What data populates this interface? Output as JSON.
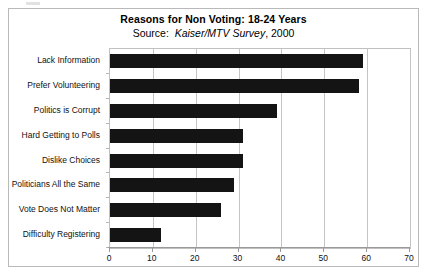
{
  "chart_data": {
    "type": "bar",
    "orientation": "horizontal",
    "title": "Reasons for Non Voting: 18-24 Years",
    "subtitle_prefix": "Source:  ",
    "subtitle_source_italic": "Kaiser/MTV Survey",
    "subtitle_suffix": ", 2000",
    "categories": [
      "Lack Information",
      "Prefer Volunteering",
      "Politics is Corrupt",
      "Hard Getting to Polls",
      "Dislike Choices",
      "Politicians All the Same",
      "Vote Does Not Matter",
      "Difficulty Registering"
    ],
    "values": [
      59,
      58,
      39,
      31,
      31,
      29,
      26,
      12
    ],
    "xlabel": "",
    "ylabel": "",
    "xlim": [
      0,
      70
    ],
    "xticks": [
      0,
      10,
      20,
      30,
      40,
      50,
      60,
      70
    ],
    "xtick_labels": [
      "0",
      "10",
      "20",
      "30",
      "40",
      "50",
      "60",
      "70"
    ],
    "grid": "vertical",
    "legend": "none",
    "bar_color": "#141414",
    "background_color": "#ffffff",
    "grid_color": "#c4c4c4"
  }
}
